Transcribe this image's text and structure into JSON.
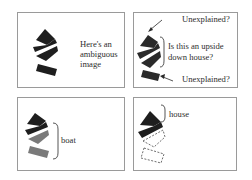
{
  "panels": [
    {
      "id": "ambiguous",
      "caption_lines": [
        "Here's an",
        "ambiguous",
        "image"
      ]
    },
    {
      "id": "question",
      "top_label": "Unexplained?",
      "question_lines": [
        "Is this an upside",
        "down house?"
      ],
      "bottom_label": "Unexplained?"
    },
    {
      "id": "boat",
      "label": "boat"
    },
    {
      "id": "house",
      "label": "house"
    }
  ],
  "colors": {
    "shape_dark": "#1e1e1e",
    "shape_gray": "#7a7a7a",
    "frame": "#9a9a9a",
    "text": "#2e2e2e"
  }
}
